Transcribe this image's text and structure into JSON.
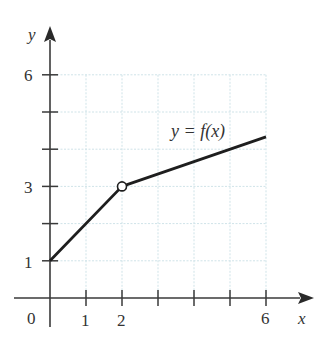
{
  "chart_data": {
    "type": "line",
    "title": "",
    "xlabel": "x",
    "ylabel": "y",
    "xlim": [
      0,
      6.7
    ],
    "ylim": [
      0,
      6.3
    ],
    "grid": true,
    "x_ticks": [
      1,
      2,
      3,
      4,
      5,
      6
    ],
    "x_tick_labels": [
      "1",
      "2",
      "",
      "",
      "",
      "6"
    ],
    "y_ticks": [
      1,
      2,
      3,
      4,
      5,
      6
    ],
    "y_tick_labels": [
      "1",
      "",
      "3",
      "",
      "",
      "6"
    ],
    "origin_label": "0",
    "series": [
      {
        "name": "y = f(x)",
        "points": [
          [
            0,
            1
          ],
          [
            2,
            3
          ],
          [
            6,
            4.33
          ]
        ],
        "open_circles": [
          [
            2,
            3
          ]
        ]
      }
    ],
    "annotations": [
      {
        "text": "y = f(x)",
        "x": 4.6,
        "y": 4.8
      }
    ]
  },
  "labels": {
    "x_axis": "x",
    "y_axis": "y",
    "origin": "0",
    "xt1": "1",
    "xt2": "2",
    "xt6": "6",
    "yt1": "1",
    "yt3": "3",
    "yt6": "6",
    "curve": "y = f(x)"
  },
  "colors": {
    "axis": "#3a3a3a",
    "grid": "#cfe3e8",
    "curve": "#1e1e1e"
  }
}
